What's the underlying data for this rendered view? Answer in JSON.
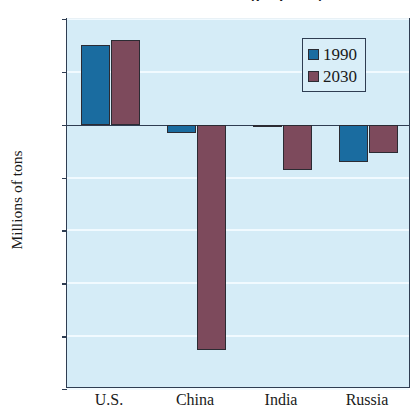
{
  "chart_data": {
    "type": "bar",
    "title": "1990 and 2030 (projected)",
    "xlabel": "",
    "ylabel": "Millions of tons",
    "categories": [
      "U.S.",
      "China",
      "India",
      "Russia"
    ],
    "series": [
      {
        "name": "1990",
        "color": "#1a6ca0",
        "values": [
          75,
          -8,
          -2,
          -35
        ]
      },
      {
        "name": "2030",
        "color": "#7d4a5c",
        "values": [
          80,
          -213,
          -43,
          -27
        ]
      }
    ],
    "ylim": [
      -250,
      100
    ],
    "yticks": [
      100,
      50,
      0,
      -50,
      -100,
      -150,
      -200,
      -250
    ],
    "ytick_labels": [
      "100",
      "50",
      "0",
      "–50",
      "–100",
      "–150",
      "–200",
      "–250"
    ],
    "grid": true,
    "legend_position": "top-right",
    "plot_background": "#d5ecf7",
    "frame_color": "#2f3d52"
  },
  "legend": {
    "entries": [
      {
        "label": "1990"
      },
      {
        "label": "2030"
      }
    ]
  }
}
